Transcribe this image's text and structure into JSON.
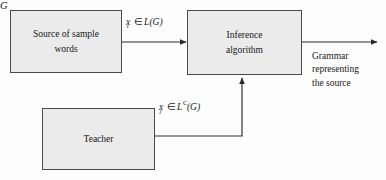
{
  "diagram": {
    "background_color": "#fdfdfd",
    "box_fill_color": "#ebebeb",
    "box_border_color": "#4a4a4a",
    "line_color": "#2b2b2b",
    "nodes": {
      "source": {
        "label_line1": "Source of sample",
        "label_line2": "words"
      },
      "inference": {
        "label_line1": "Inference",
        "label_line2": "algorithm"
      },
      "teacher": {
        "label": "Teacher"
      }
    },
    "edges": {
      "source_to_inference": {
        "variable": "x",
        "subscript": "i",
        "membership": "∈",
        "language": "L(G)",
        "full_text": "x_i ∈ L(G)"
      },
      "teacher_to_inference": {
        "variable": "x",
        "subscript": "j",
        "membership": "∈",
        "superscript": "C",
        "language_prefix": "L",
        "language_suffix": "(G)",
        "full_text": "x_j ∈ L^C(G)"
      },
      "inference_output": {
        "symbol": "G",
        "description_line1": "Grammar",
        "description_line2": "representing",
        "description_line3": "the source"
      }
    }
  }
}
